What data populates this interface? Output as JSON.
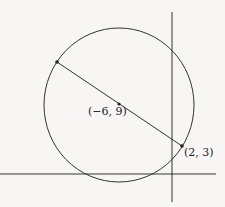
{
  "diagram": {
    "type": "coordinate-geometry",
    "colors": {
      "stroke": "#333333",
      "background": "#f7f6f4"
    },
    "center": {
      "label": "(−6, 9)",
      "x": -6,
      "y": 9
    },
    "endpoint": {
      "label": "(2, 3)",
      "x": 2,
      "y": 3
    },
    "other_endpoint": {
      "label": ""
    }
  }
}
